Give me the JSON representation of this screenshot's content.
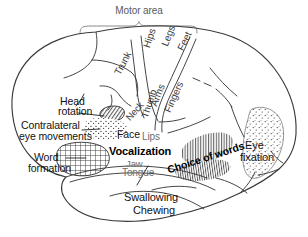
{
  "figure": {
    "title": "Motor area"
  },
  "labels": {
    "motor_area": "Motor area",
    "trunk": "Trunk",
    "hips": "Hips",
    "legs": "Legs",
    "feet": "Feet",
    "arms": "Arms",
    "fingers": "Fingers",
    "neck": "Neck",
    "thumb": "Thumb",
    "face": "Face",
    "lips": "Lips",
    "jaw": "Jaw",
    "tongue": "Tongue",
    "vocalization": "Vocalization",
    "head_rotation_line1": "Head",
    "head_rotation_line2": "rotation",
    "contralateral_line1": "Contralateral",
    "contralateral_line2": "eye movements",
    "word_formation_line1": "Word",
    "word_formation_line2": "formation",
    "choice_of_words": "Choice of words",
    "eye_fixation_line1": "Eye",
    "eye_fixation_line2": "fixation",
    "swallowing": "Swallowing",
    "chewing": "Chewing"
  },
  "regions": [
    {
      "name": "head-rotation-region",
      "fill": "diagonal-hatch",
      "label": "Head rotation"
    },
    {
      "name": "contralateral-eye-region",
      "fill": "stipple",
      "label": "Contralateral eye movements"
    },
    {
      "name": "word-formation-region",
      "fill": "cross-hatch",
      "label": "Word formation"
    },
    {
      "name": "choice-of-words-region",
      "fill": "vertical-hatch",
      "label": "Choice of words"
    },
    {
      "name": "eye-fixation-region",
      "fill": "stipple",
      "label": "Eye fixation"
    }
  ],
  "colors": {
    "background": "#ffffff",
    "ink": "#111111",
    "outline": "#3a3a3a",
    "gray_text": "#6d6d6d",
    "title_text": "#5a5a5a"
  }
}
